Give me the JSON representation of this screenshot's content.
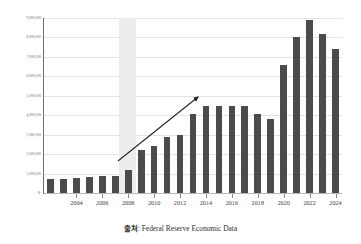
{
  "caption": {
    "source_label": "출처",
    "separator": ": ",
    "source_text": "Federal Reserve Economic Data"
  },
  "colors": {
    "bar": "#4b4b4b",
    "grid": "#e3e3e3",
    "axis": "#6e6e6e",
    "recession_band": "#ededed",
    "arrow": "#1f1f1f",
    "background": "#ffffff"
  },
  "annotations": [
    {
      "name": "upward-trend-arrow",
      "type": "arrow",
      "x1": 118,
      "y1": 161,
      "x2": 198,
      "y2": 97
    }
  ],
  "bands": [
    {
      "name": "recession-band",
      "start_year": 2008,
      "end_year": 2009,
      "x_start_pct": 25.2,
      "x_end_pct": 30.9
    }
  ],
  "chart_data": {
    "type": "bar",
    "title": "",
    "xlabel": "",
    "ylabel": "",
    "grid": true,
    "legend": "none",
    "ylim": [
      0,
      9000000
    ],
    "ytick_values": [
      0,
      1000000,
      2000000,
      3000000,
      4000000,
      5000000,
      6000000,
      7000000,
      8000000,
      9000000
    ],
    "ytick_labels": [
      "$-",
      "1,000,000",
      "2,000,000",
      "3,000,000",
      "4,000,000",
      "5,000,000",
      "6,000,000",
      "7,000,000",
      "8,000,000",
      "9,000,000"
    ],
    "categories": [
      2002,
      2003,
      2004,
      2005,
      2006,
      2007,
      2008,
      2009,
      2010,
      2011,
      2012,
      2013,
      2014,
      2015,
      2016,
      2017,
      2018,
      2019,
      2020,
      2021,
      2022,
      2023,
      2024
    ],
    "xtick_labels": [
      "2004",
      "2006",
      "2008",
      "2010",
      "2012",
      "2014",
      "2016",
      "2018",
      "2020",
      "2022",
      "2024"
    ],
    "xtick_categories": [
      2004,
      2006,
      2008,
      2010,
      2012,
      2014,
      2016,
      2018,
      2020,
      2022,
      2024
    ],
    "values": [
      700000,
      730000,
      780000,
      820000,
      870000,
      890000,
      1200000,
      2200000,
      2400000,
      2900000,
      3000000,
      4050000,
      4500000,
      4500000,
      4450000,
      4450000,
      4050000,
      3800000,
      6600000,
      8000000,
      8900000,
      8200000,
      7400000
    ],
    "series": [
      {
        "name": "Federal Reserve Total Assets",
        "values": [
          700000,
          730000,
          780000,
          820000,
          870000,
          890000,
          1200000,
          2200000,
          2400000,
          2900000,
          3000000,
          4050000,
          4500000,
          4500000,
          4450000,
          4450000,
          4050000,
          3800000,
          6600000,
          8000000,
          8900000,
          8200000,
          7400000
        ]
      }
    ]
  }
}
